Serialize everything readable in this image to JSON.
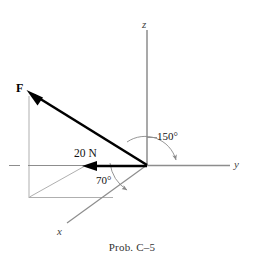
{
  "figure": {
    "caption": "Prob. C–5",
    "background_color": "#ffffff",
    "axes": {
      "z_label": "z",
      "y_label": "y",
      "x_label": "x",
      "axis_color": "#6e6e6e",
      "origin": {
        "x": 147,
        "y": 165
      }
    },
    "force_vector": {
      "symbol": "F",
      "magnitude_label": "20 N",
      "vector_color": "#000000",
      "tip": {
        "x": 29,
        "y": 92
      },
      "tail": {
        "x": 147,
        "y": 165
      },
      "projection_tip": {
        "x": 83,
        "y": 166
      }
    },
    "angles": [
      {
        "name": "angle-from-y-axis",
        "label": "150°",
        "value": 150,
        "unit": "degrees",
        "arc_color": "#7a7a7a"
      },
      {
        "name": "angle-from-x-axis",
        "label": "70°",
        "value": 70,
        "unit": "degrees",
        "arc_color": "#7a7a7a"
      }
    ],
    "construction_lines": {
      "color": "#9a9a9a",
      "description": "projection box and helper arc"
    }
  }
}
